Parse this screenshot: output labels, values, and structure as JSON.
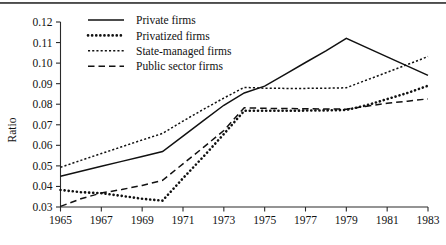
{
  "chart_data": {
    "type": "line",
    "title": "",
    "xlabel": "",
    "ylabel": "Ratio",
    "xlim": [
      1965,
      1983
    ],
    "ylim": [
      0.03,
      0.12
    ],
    "ytick_step": 0.01,
    "xtick_step": 2,
    "grid": false,
    "legend_position": "top-center",
    "x": [
      1965,
      1966,
      1967,
      1968,
      1969,
      1970,
      1971,
      1972,
      1973,
      1974,
      1975,
      1976,
      1977,
      1978,
      1979,
      1980,
      1981,
      1982,
      1983
    ],
    "xticklabels": [
      "1965",
      "1967",
      "1969",
      "1971",
      "1973",
      "1975",
      "1977",
      "1979",
      "1981",
      "1983"
    ],
    "yticklabels": [
      "0.03",
      "0.04",
      "0.05",
      "0.06",
      "0.07",
      "0.08",
      "0.09",
      "0.10",
      "0.11",
      "0.12"
    ],
    "series": [
      {
        "name": "Private firms",
        "style": "solid",
        "values": [
          0.045,
          0.0474,
          0.0498,
          0.0522,
          0.0546,
          0.057,
          0.0645,
          0.072,
          0.0795,
          0.0855,
          0.0888,
          0.0945,
          0.1003,
          0.106,
          0.112,
          0.1075,
          0.103,
          0.0985,
          0.094
        ]
      },
      {
        "name": "Privatized firms",
        "style": "thick-dotted",
        "values": [
          0.0383,
          0.0372,
          0.0367,
          0.0354,
          0.034,
          0.0331,
          0.044,
          0.0545,
          0.0655,
          0.0768,
          0.0768,
          0.0768,
          0.0769,
          0.077,
          0.0772,
          0.0795,
          0.0825,
          0.0855,
          0.089
        ]
      },
      {
        "name": "State-managed firms",
        "style": "thin-dotted",
        "values": [
          0.0493,
          0.0527,
          0.056,
          0.0593,
          0.0626,
          0.0658,
          0.0718,
          0.0775,
          0.083,
          0.0882,
          0.0878,
          0.0877,
          0.0877,
          0.0878,
          0.088,
          0.0918,
          0.0955,
          0.0993,
          0.1032
        ]
      },
      {
        "name": "Public sector firms",
        "style": "dashed",
        "values": [
          0.0303,
          0.034,
          0.0368,
          0.0385,
          0.0405,
          0.043,
          0.051,
          0.059,
          0.0672,
          0.0783,
          0.078,
          0.0779,
          0.0778,
          0.0777,
          0.0776,
          0.079,
          0.0805,
          0.0815,
          0.0826
        ]
      }
    ]
  },
  "legend": {
    "entries": [
      {
        "label": "Private firms",
        "style": "solid"
      },
      {
        "label": "Privatized firms",
        "style": "thick-dotted"
      },
      {
        "label": "State-managed firms",
        "style": "thin-dotted"
      },
      {
        "label": "Public sector firms",
        "style": "dashed"
      }
    ]
  }
}
